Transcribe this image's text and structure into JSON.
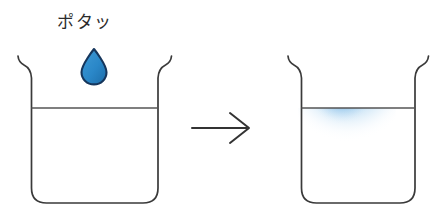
{
  "figure": {
    "name": "diffusion-of-dye-in-water",
    "background_color": "#ffffff",
    "width": 444,
    "height": 215
  },
  "annotations": {
    "drip_label": "ポタッ"
  },
  "colors": {
    "outline": "#3a3a3a",
    "water_line": "#555555",
    "droplet_fill": "#2a87c8",
    "droplet_outline": "#16365c",
    "dye_core": "#1f7fd0",
    "dye_mid": "#5aa8e0",
    "dye_edge": "#cfe5f7",
    "arrow": "#333333",
    "text": "#2b2b2b"
  },
  "left_beaker": {
    "name": "beaker-before",
    "state_label": "before",
    "contains_dye": false,
    "water_level_y": 108
  },
  "right_beaker": {
    "name": "beaker-after",
    "state_label": "after",
    "contains_dye": true,
    "water_level_y": 108
  },
  "droplet": {
    "name": "ink-droplet",
    "label": "ポタッ"
  },
  "arrow": {
    "name": "transition-arrow",
    "direction": "right"
  }
}
